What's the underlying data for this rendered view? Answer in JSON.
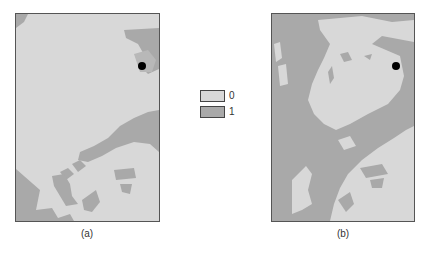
{
  "figure": {
    "panels": [
      {
        "id": "a",
        "caption": "(a)",
        "marker": {
          "x": 126,
          "y": 52
        }
      },
      {
        "id": "b",
        "caption": "(b)",
        "marker": {
          "x": 124,
          "y": 52
        }
      }
    ],
    "legend": {
      "items": [
        {
          "label": "0",
          "color": "#d8d8d8"
        },
        {
          "label": "1",
          "color": "#a9a9a9"
        }
      ]
    },
    "colors": {
      "class_0": "#d8d8d8",
      "class_1": "#a9a9a9",
      "marker": "#000000",
      "border": "#555555"
    }
  }
}
